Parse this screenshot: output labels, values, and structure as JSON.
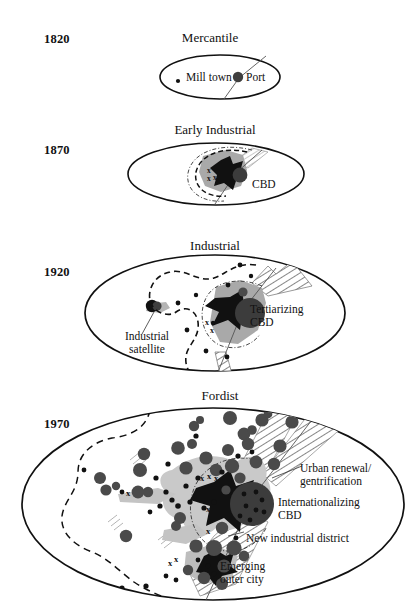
{
  "figure": {
    "type": "conceptual-diagram",
    "panel_count": 4
  },
  "panels": [
    {
      "year": "1820",
      "title": "Mercantile",
      "labels": [
        {
          "id": "mill-town",
          "text": "Mill town"
        },
        {
          "id": "port",
          "text": "Port"
        }
      ]
    },
    {
      "year": "1870",
      "title": "Early Industrial",
      "labels": [
        {
          "id": "cbd",
          "text": "CBD"
        }
      ]
    },
    {
      "year": "1920",
      "title": "Industrial",
      "labels": [
        {
          "id": "industrial-satellite",
          "text": "Industrial\nsatellite",
          "line1": "Industrial",
          "line2": "satellite"
        },
        {
          "id": "tertiarizing-cbd",
          "text": "Tertiarizing CBD",
          "line1": "Tertiarizing",
          "line2": "CBD"
        }
      ]
    },
    {
      "year": "1970",
      "title": "Fordist",
      "labels": [
        {
          "id": "urban-renewal",
          "text": "Urban renewal/ gentrification",
          "line1": "Urban renewal/",
          "line2": "gentrification"
        },
        {
          "id": "internationalizing-cbd",
          "text": "Internationalizing CBD",
          "line1": "Internationalizing",
          "line2": "CBD"
        },
        {
          "id": "new-industrial-district",
          "text": "New industrial district",
          "line1": "New industrial district",
          "line2": ""
        },
        {
          "id": "emerging-outer-city",
          "text": "Emerging outer city",
          "line1": "Emerging",
          "line2": "outer city"
        }
      ]
    }
  ],
  "marks": {
    "x_symbol": "x",
    "colors": {
      "outline": "#111111",
      "core_black": "#111111",
      "cbd_dark": "#3c3c3c",
      "node_dark": "#4a4a4a",
      "built_gray": "#a8a8a8",
      "halo_gray": "#c9c9c9",
      "hatch_gray": "#6f6f6f"
    }
  }
}
